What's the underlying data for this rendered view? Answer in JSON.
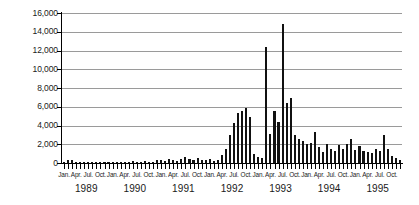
{
  "chart_data": {
    "type": "bar",
    "title": "",
    "subtitle": "",
    "xlabel": "",
    "ylabel": "",
    "ylim": [
      0,
      16000
    ],
    "y_ticks": [
      0,
      2000,
      4000,
      6000,
      8000,
      10000,
      12000,
      14000,
      16000
    ],
    "y_tick_labels": [
      "0",
      "2,000",
      "4,000",
      "6,000",
      "8,000",
      "10,000",
      "12,000",
      "14,000",
      "16,000"
    ],
    "grid": true,
    "legend": null,
    "legend_position": "none",
    "bar_color": "#111111",
    "grid_color": "#9a9a9a",
    "axis_color": "#000000",
    "x_tick_interval": "monthly",
    "x_label_interval": "quarterly",
    "quarter_labels": [
      "Jan.",
      "Apr.",
      "Jul.",
      "Oct."
    ],
    "years": [
      "1989",
      "1990",
      "1991",
      "1992",
      "1993",
      "1994",
      "1995"
    ],
    "categories": [
      "Jan. 1989",
      "Feb. 1989",
      "Mar. 1989",
      "Apr. 1989",
      "May 1989",
      "Jun. 1989",
      "Jul. 1989",
      "Aug. 1989",
      "Sep. 1989",
      "Oct. 1989",
      "Nov. 1989",
      "Dec. 1989",
      "Jan. 1990",
      "Feb. 1990",
      "Mar. 1990",
      "Apr. 1990",
      "May 1990",
      "Jun. 1990",
      "Jul. 1990",
      "Aug. 1990",
      "Sep. 1990",
      "Oct. 1990",
      "Nov. 1990",
      "Dec. 1990",
      "Jan. 1991",
      "Feb. 1991",
      "Mar. 1991",
      "Apr. 1991",
      "May 1991",
      "Jun. 1991",
      "Jul. 1991",
      "Aug. 1991",
      "Sep. 1991",
      "Oct. 1991",
      "Nov. 1991",
      "Dec. 1991",
      "Jan. 1992",
      "Feb. 1992",
      "Mar. 1992",
      "Apr. 1992",
      "May 1992",
      "Jun. 1992",
      "Jul. 1992",
      "Aug. 1992",
      "Sep. 1992",
      "Oct. 1992",
      "Nov. 1992",
      "Dec. 1992",
      "Jan. 1993",
      "Feb. 1993",
      "Mar. 1993",
      "Apr. 1993",
      "May 1993",
      "Jun. 1993",
      "Jul. 1993",
      "Aug. 1993",
      "Sep. 1993",
      "Oct. 1993",
      "Nov. 1993",
      "Dec. 1993",
      "Jan. 1994",
      "Feb. 1994",
      "Mar. 1994",
      "Apr. 1994",
      "May 1994",
      "Jun. 1994",
      "Jul. 1994",
      "Aug. 1994",
      "Sep. 1994",
      "Oct. 1994",
      "Nov. 1994",
      "Dec. 1994",
      "Jan. 1995",
      "Feb. 1995",
      "Mar. 1995",
      "Apr. 1995",
      "May 1995",
      "Jun. 1995",
      "Jul. 1995",
      "Aug. 1995",
      "Sep. 1995",
      "Oct. 1995",
      "Nov. 1995",
      "Dec. 1995"
    ],
    "values": [
      120,
      300,
      320,
      140,
      150,
      130,
      120,
      150,
      140,
      120,
      130,
      150,
      140,
      130,
      160,
      140,
      150,
      170,
      160,
      150,
      170,
      160,
      150,
      300,
      320,
      180,
      400,
      300,
      200,
      420,
      650,
      380,
      330,
      560,
      350,
      300,
      400,
      260,
      300,
      900,
      1450,
      3000,
      4300,
      5300,
      5600,
      5900,
      4900,
      1000,
      600,
      500,
      12400,
      3100,
      5600,
      4400,
      14800,
      6400,
      6900,
      3000,
      2600,
      2400,
      2000,
      2100,
      3300,
      1700,
      1200,
      2000,
      1500,
      1300,
      1900,
      1500,
      2000,
      2600,
      1400,
      1800,
      1300,
      1200,
      1100,
      1500,
      1300,
      3000,
      1500,
      800,
      500,
      300
    ]
  }
}
